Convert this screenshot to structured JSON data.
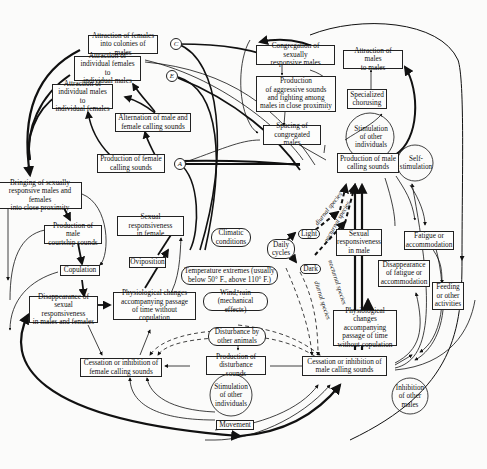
{
  "diagram": {
    "type": "flow-diagram",
    "nodes": {
      "attr_fem_colonies": "Attraction of females\ninto colonies of males",
      "attr_ind_fem": "Attraction of\nindividual females to\nindividual males",
      "attr_ind_male": "Attraction of\nindividual males to\nindividual females",
      "alternation": "Alternation of male and\nfemale calling sounds",
      "prod_female_calling": "Production of female\ncalling sounds",
      "congregation": "Congregation of sexually\nresponsive males",
      "attr_males_males": "Attraction of males\nto males",
      "aggressive": "Production\nof aggressive sounds\nand fighting among\nmales in close proximity",
      "specialized": "Specialized\nchorusing",
      "spacing": "Spacing of\ncongregated males",
      "stim_other_top": "Stimulation\nof other\nindividuals",
      "prod_male_calling": "Production of male\ncalling sounds",
      "self_stim": "Self-\nstimulation",
      "bringing": "Bringing of sexually\nresponsive males and females\ninto close proximity",
      "courtship": "Production of male\ncourtship sounds",
      "copulation": "Copulation",
      "disappearance_resp": "Disappearance of\nsexual responsiveness\nin males and females",
      "oviposition": "Oviposition",
      "sexual_resp_female": "Sexual responsiveness\nin female",
      "physio_female": "Physiological changes\naccompanying passage\nof time without copulation",
      "climatic": "Climatic\nconditions",
      "daily_cycles": "Daily\ncycles",
      "light": "Light",
      "dark": "Dark",
      "temperature": "Temperature extremes (usually\nbelow 50° F., above 110° F.)",
      "wind": "Wind, rain\n(mechanical effects)",
      "disturbance_animals": "Disturbance by\nother animals",
      "prod_disturbance": "Production of\ndisturbance sounds",
      "stim_other_bottom": "Stimulation\nof other\nindividuals",
      "movement": "Movement",
      "cessation_female": "Cessation or inhibition of\nfemale calling sounds",
      "cessation_male": "Cessation or inhibition of\nmale calling sounds",
      "inhibition_males": "Inhibition\nof other\nmales",
      "sexual_resp_male": "Sexual\nresponsiveness\nin male",
      "physio_male": "Physiological changes\naccompanying\npassage of time\nwithout copulation",
      "fatigue": "Fatigue or\naccommodation",
      "disappearance_fatigue": "Disappearance\nof fatigue or\naccommodation",
      "feeding": "Feeding\nor other\nactivities"
    },
    "connectors": {
      "a": "A",
      "c": "C",
      "e": "E"
    },
    "edge_labels": {
      "diurnal_1": "diurnal species",
      "nocturnal_1": "nocturnal species",
      "nocturnal_2": "nocturnal species",
      "diurnal_2": "diurnal species"
    }
  }
}
